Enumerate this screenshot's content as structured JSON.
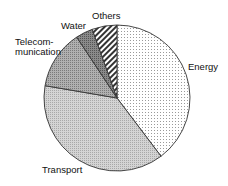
{
  "chart_data": {
    "type": "pie",
    "title": "",
    "start_angle_deg": 0,
    "direction": "clockwise",
    "slices": [
      {
        "label": "Energy",
        "value": 39.7,
        "pattern": "dots"
      },
      {
        "label": "Transport",
        "value": 38.0,
        "pattern": "fine-crosshatch"
      },
      {
        "label": "Telecom-\nmunication",
        "value": 13.0,
        "pattern": "dense-gray"
      },
      {
        "label": "Water",
        "value": 3.8,
        "pattern": "dark-gray"
      },
      {
        "label": "Others",
        "value": 5.5,
        "pattern": "diagonal-stripes"
      }
    ],
    "legend": "none (labels placed beside slices)"
  },
  "labels": {
    "energy": "Energy",
    "transport": "Transport",
    "telecom_line1": "Telecom-",
    "telecom_line2": "munication",
    "water": "Water",
    "others": "Others"
  }
}
